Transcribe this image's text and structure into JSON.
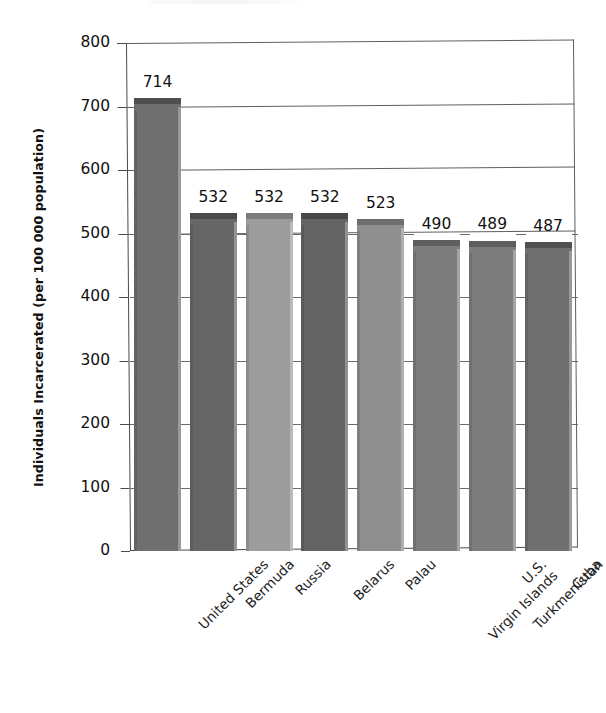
{
  "chart_data": {
    "type": "bar",
    "title": "",
    "subtitle": "",
    "xlabel": "",
    "ylabel": "Individuals Incarcerated (per 100 000 population)",
    "categories": [
      "United States",
      "Bermuda",
      "Russia",
      "Belarus",
      "Palau",
      "U.S. Virgin Islands",
      "Turkmenistan",
      "Cuba"
    ],
    "category_lines": [
      [
        "United States"
      ],
      [
        "Bermuda"
      ],
      [
        "Russia"
      ],
      [
        "Belarus"
      ],
      [
        "Palau"
      ],
      [
        "U.S.",
        "Virgin Islands"
      ],
      [
        "Turkmenistan"
      ],
      [
        "Cuba"
      ]
    ],
    "values": [
      714,
      532,
      532,
      532,
      523,
      490,
      489,
      487
    ],
    "value_labels": [
      "714",
      "532",
      "532",
      "532",
      "523",
      "490",
      "489",
      "487"
    ],
    "ylim": [
      0,
      800
    ],
    "ytick_values": [
      0,
      100,
      200,
      300,
      400,
      500,
      600,
      700,
      800
    ],
    "ytick_labels": [
      "0",
      "100",
      "200",
      "300",
      "400",
      "500",
      "600",
      "700",
      "800"
    ],
    "gridlines_at": [
      500,
      600,
      700,
      800
    ],
    "grid": true,
    "legend": "none",
    "style": "3d-grayscale-bars",
    "bar_colors": [
      "#6f6f6f",
      "#666666",
      "#9c9c9c",
      "#646464",
      "#8f8f8f",
      "#7d7d7d",
      "#7d7d7d",
      "#6f6f6f"
    ],
    "bar_cap_colors": [
      "#4f4f4f",
      "#4a4a4a",
      "#7c7c7c",
      "#474747",
      "#6e6e6e",
      "#5e5e5e",
      "#5e5e5e",
      "#515151"
    ]
  },
  "axis": {
    "line_color": "#4a4a4a",
    "grid_color": "#5e5e5e"
  },
  "page": {
    "background": "#ffffff"
  }
}
